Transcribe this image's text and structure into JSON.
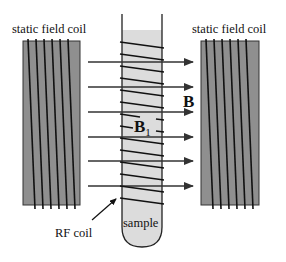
{
  "labels": {
    "left_coil": "static field coil",
    "right_coil": "static field coil",
    "static_field": "B",
    "rf_field": "B",
    "rf_field_subscript": "1",
    "rf_coil": "RF coil",
    "sample": "sample"
  },
  "colors": {
    "coil_fill": "#8f8f8f",
    "sample_fill": "#dcdcdc",
    "line": "#1a1a1a",
    "background": "#ffffff"
  },
  "diagram": {
    "left_coil": {
      "x": 23,
      "y": 41,
      "w": 57,
      "h": 164,
      "windings": 6
    },
    "right_coil": {
      "x": 201,
      "y": 41,
      "w": 58,
      "h": 164,
      "windings": 6
    },
    "tube": {
      "x_left": 122,
      "x_right": 162,
      "top": 14,
      "fill_top": 30,
      "bottom": 247
    },
    "field_arrows_y": [
      62,
      87,
      112,
      137,
      161,
      186
    ],
    "field_arrows_x": [
      88,
      193
    ],
    "rf_coil_turns": 14
  }
}
